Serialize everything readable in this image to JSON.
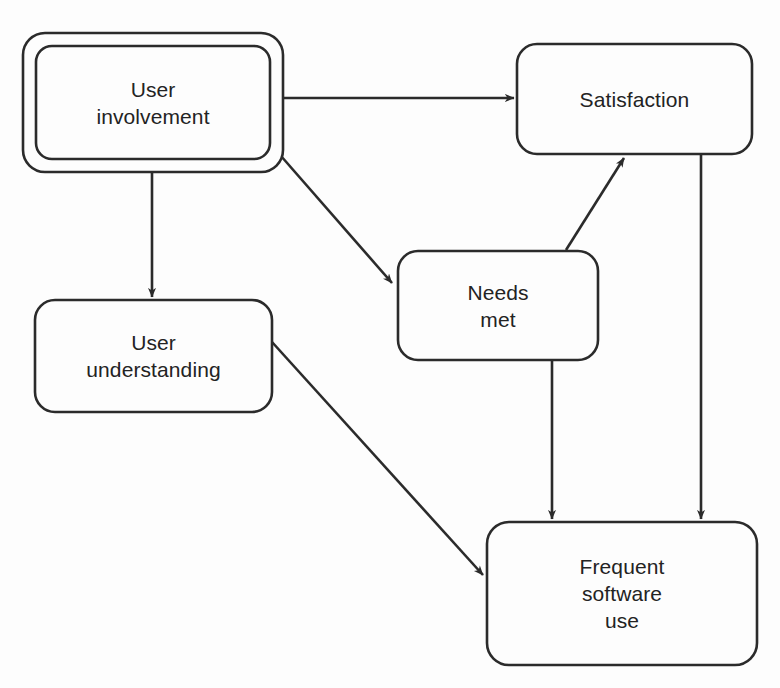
{
  "diagram": {
    "type": "flow-diagram",
    "colors": {
      "background": "#fdfdfd",
      "stroke": "#2b2b2b",
      "text": "#232323",
      "node_fill": "#fdfdfd"
    },
    "nodes": [
      {
        "id": "user-involvement",
        "label": "User\ninvolvement",
        "shape": "rounded-rectangle-double-border",
        "x": 23,
        "y": 33,
        "width": 260,
        "height": 139,
        "inner_inset": 13,
        "radius": 22
      },
      {
        "id": "satisfaction",
        "label": "Satisfaction",
        "shape": "rounded-rectangle",
        "x": 517,
        "y": 44,
        "width": 235,
        "height": 110,
        "radius": 20
      },
      {
        "id": "needs-met",
        "label": "Needs\nmet",
        "shape": "rounded-rectangle",
        "x": 398,
        "y": 251,
        "width": 200,
        "height": 109,
        "radius": 20
      },
      {
        "id": "user-understanding",
        "label": "User\nunderstanding",
        "shape": "rounded-rectangle",
        "x": 35,
        "y": 300,
        "width": 237,
        "height": 112,
        "radius": 20
      },
      {
        "id": "frequent-software-use",
        "label": "Frequent\nsoftware\nuse",
        "shape": "rounded-rectangle",
        "x": 487,
        "y": 522,
        "width": 270,
        "height": 143,
        "radius": 22
      }
    ],
    "edges": [
      {
        "id": "involvement-to-satisfaction",
        "from": "user-involvement",
        "to": "satisfaction",
        "kind": "straight-arrow",
        "path": "M 283 98 L 514 98"
      },
      {
        "id": "involvement-to-understanding",
        "from": "user-involvement",
        "to": "user-understanding",
        "kind": "straight-arrow",
        "path": "M 152 164 L 152 297"
      },
      {
        "id": "involvement-to-needs-met",
        "from": "user-involvement",
        "to": "needs-met",
        "kind": "diagonal-arrow",
        "path": "M 281 156 L 392 283"
      },
      {
        "id": "needs-met-to-satisfaction",
        "from": "needs-met",
        "to": "satisfaction",
        "kind": "diagonal-arrow",
        "path": "M 566 250 L 624 158"
      },
      {
        "id": "needs-met-to-frequent-use",
        "from": "needs-met",
        "to": "frequent-software-use",
        "kind": "straight-arrow",
        "path": "M 552 360 L 552 519"
      },
      {
        "id": "satisfaction-to-frequent-use",
        "from": "satisfaction",
        "to": "frequent-software-use",
        "kind": "straight-arrow",
        "path": "M 701 154 L 701 519"
      },
      {
        "id": "understanding-to-frequent-use",
        "from": "user-understanding",
        "to": "frequent-software-use",
        "kind": "diagonal-arrow",
        "path": "M 272 342 L 483 575"
      }
    ]
  }
}
